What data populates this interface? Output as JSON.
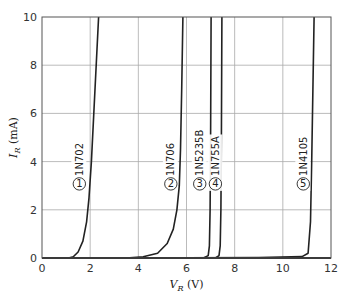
{
  "chart_data": {
    "type": "line",
    "title": "",
    "xlabel": "V_R (V)",
    "ylabel": "I_R (mA)",
    "xlim": [
      0,
      12
    ],
    "ylim": [
      0,
      10
    ],
    "xticks": [
      0,
      2,
      4,
      6,
      8,
      10,
      12
    ],
    "yticks": [
      0,
      2,
      4,
      6,
      8,
      10
    ],
    "grid": true,
    "legend": "inline labels",
    "series": [
      {
        "id": 1,
        "name": "1N702",
        "label_v": 1.55,
        "label_i": 3.2,
        "points": [
          [
            0,
            0
          ],
          [
            1.1,
            0
          ],
          [
            1.3,
            0.05
          ],
          [
            1.5,
            0.25
          ],
          [
            1.7,
            0.7
          ],
          [
            1.85,
            1.5
          ],
          [
            1.95,
            2.5
          ],
          [
            2.05,
            4
          ],
          [
            2.15,
            6
          ],
          [
            2.25,
            8
          ],
          [
            2.35,
            10
          ]
        ]
      },
      {
        "id": 2,
        "name": "1N706",
        "label_v": 5.35,
        "label_i": 3.2,
        "points": [
          [
            0,
            0
          ],
          [
            3.5,
            0
          ],
          [
            4.2,
            0.05
          ],
          [
            4.8,
            0.2
          ],
          [
            5.2,
            0.6
          ],
          [
            5.45,
            1.2
          ],
          [
            5.6,
            2
          ],
          [
            5.7,
            3
          ],
          [
            5.75,
            4.5
          ],
          [
            5.8,
            7
          ],
          [
            5.85,
            10
          ]
        ]
      },
      {
        "id": 3,
        "name": "1N5235B",
        "label_v": 6.55,
        "label_i": 3.2,
        "points": [
          [
            0,
            0
          ],
          [
            6.7,
            0
          ],
          [
            6.9,
            0.1
          ],
          [
            6.95,
            0.5
          ],
          [
            6.98,
            2
          ],
          [
            7.0,
            5
          ],
          [
            7.02,
            10
          ]
        ]
      },
      {
        "id": 4,
        "name": "1N755A",
        "label_v": 7.2,
        "label_i": 3.2,
        "points": [
          [
            0,
            0
          ],
          [
            7.2,
            0
          ],
          [
            7.35,
            0.1
          ],
          [
            7.4,
            0.5
          ],
          [
            7.43,
            2
          ],
          [
            7.45,
            5
          ],
          [
            7.47,
            10
          ]
        ]
      },
      {
        "id": 5,
        "name": "1N4105",
        "label_v": 10.85,
        "label_i": 3.2,
        "points": [
          [
            0,
            0
          ],
          [
            3,
            0
          ],
          [
            9,
            0.02
          ],
          [
            10.8,
            0.06
          ],
          [
            11.05,
            0.2
          ],
          [
            11.15,
            1.5
          ],
          [
            11.2,
            4
          ],
          [
            11.25,
            7
          ],
          [
            11.3,
            10
          ]
        ]
      }
    ]
  }
}
